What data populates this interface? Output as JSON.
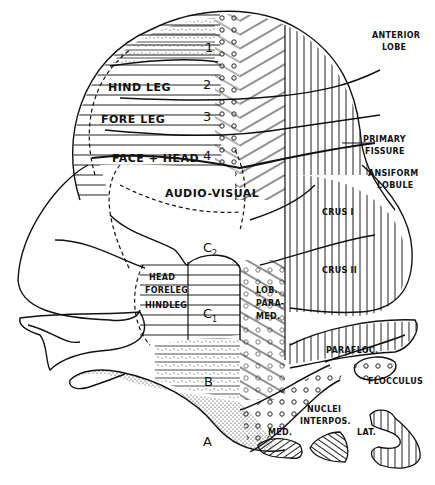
{
  "diagram": {
    "regions": {
      "anterior_lobe": "ANTERIOR LOBE",
      "anterior_lobe_line1": "ANTERIOR",
      "anterior_lobe_line2": "LOBE",
      "primary_fissure_line1": "PRIMARY",
      "primary_fissure_line2": "FISSURE",
      "ansiform_line1": "ANSIFORM",
      "ansiform_line2": "LOBULE",
      "crus1": "CRUS I",
      "crus2": "CRUS II",
      "lob_paramed_line1": "LOB.",
      "lob_paramed_line2": "PARA-",
      "lob_paramed_line3": "MED.",
      "paraflocculus": "PARAFLOC.",
      "flocculus": "FLOCCULUS",
      "nuclei_line1": "NUCLEI",
      "nuclei_line2": "INTERPOS.",
      "nucleus_med": "MED.",
      "nucleus_lat": "LAT."
    },
    "anterior_zones": [
      {
        "number": "1",
        "label": ""
      },
      {
        "number": "2",
        "label": "HIND LEG"
      },
      {
        "number": "3",
        "label": "FORE LEG"
      },
      {
        "number": "4",
        "label": "FACE + HEAD"
      }
    ],
    "audio_visual": "AUDIO-VISUAL",
    "paramedian_zones": {
      "head": "HEAD",
      "foreleg": "FORELEG",
      "hindleg": "HINDLEG"
    },
    "section_labels": {
      "c2": "C",
      "c2_sub": "2",
      "c1": "C",
      "c1_sub": "1",
      "b": "B",
      "a": "A"
    }
  }
}
